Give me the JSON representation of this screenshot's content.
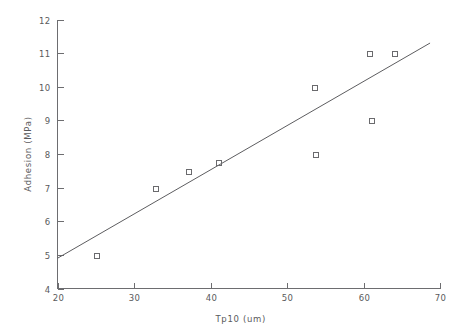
{
  "chart_data": {
    "type": "scatter",
    "title": "",
    "xlabel": "Tp10  (um)",
    "ylabel": "Adhesion  (MPa)",
    "xlim": [
      20,
      70
    ],
    "ylim": [
      4,
      12
    ],
    "xticks": [
      20,
      30,
      40,
      50,
      60,
      70
    ],
    "yticks": [
      4,
      5,
      6,
      7,
      8,
      9,
      10,
      11,
      12
    ],
    "xtick_labels": [
      "20",
      "30",
      "40",
      "50",
      "60",
      "70"
    ],
    "ytick_labels": [
      "4",
      "5",
      "6",
      "7",
      "8",
      "9",
      "10",
      "11",
      "12"
    ],
    "grid": false,
    "legend": false,
    "marker": "open-square",
    "marker_color": "#6a6a6d",
    "line_color": "#5d5d60",
    "points": [
      {
        "x": 25.0,
        "y": 5.0
      },
      {
        "x": 32.7,
        "y": 7.0
      },
      {
        "x": 37.0,
        "y": 7.5
      },
      {
        "x": 41.0,
        "y": 7.75
      },
      {
        "x": 53.5,
        "y": 10.0
      },
      {
        "x": 53.7,
        "y": 8.0
      },
      {
        "x": 60.7,
        "y": 11.0
      },
      {
        "x": 61.0,
        "y": 9.0
      },
      {
        "x": 64.0,
        "y": 11.0
      }
    ],
    "fit_line": {
      "x": [
        20.0,
        68.7
      ],
      "y": [
        4.9,
        11.3
      ]
    }
  }
}
